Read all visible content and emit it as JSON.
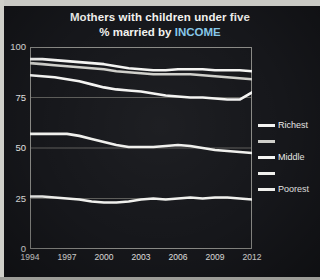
{
  "chart_data": {
    "type": "line",
    "title": "Mothers with children under five",
    "subtitle": "% married by INCOME",
    "subtitle_prefix": "% married by ",
    "subtitle_accent": "INCOME",
    "xlabel": "",
    "ylabel": "",
    "xlim": [
      1994,
      2012
    ],
    "ylim": [
      0,
      100
    ],
    "grid": true,
    "legend_position": "right",
    "y_ticks": [
      100,
      75,
      50,
      25,
      0
    ],
    "x_ticks": [
      1994,
      1997,
      2000,
      2003,
      2006,
      2009,
      2012
    ],
    "x": [
      1994,
      1995,
      1996,
      1997,
      1998,
      1999,
      2000,
      2001,
      2002,
      2003,
      2004,
      2005,
      2006,
      2007,
      2008,
      2009,
      2010,
      2011,
      2012
    ],
    "series": [
      {
        "name": "Richest",
        "color": "#f4f4f2",
        "values": [
          94,
          94,
          93.5,
          93,
          92.5,
          92,
          91.5,
          90.5,
          89.5,
          89,
          88.5,
          88.5,
          89,
          89,
          89,
          88.5,
          88.5,
          88.5,
          88
        ]
      },
      {
        "name": "",
        "color": "#cfcfca",
        "values": [
          92,
          91.5,
          91,
          90.5,
          90,
          89.5,
          89,
          88,
          87.5,
          87,
          86.5,
          86.5,
          86.5,
          86.5,
          86,
          85.5,
          85,
          84.5,
          84
        ]
      },
      {
        "name": "Middle",
        "color": "#f4f4f2",
        "values": [
          86,
          85.5,
          85,
          84,
          83,
          81.5,
          80,
          79,
          78.5,
          78,
          77,
          76,
          75.5,
          75,
          75,
          74.5,
          74,
          74,
          77.5
        ]
      },
      {
        "name": "",
        "color": "#f0f0ed",
        "values": [
          57,
          57,
          57,
          57,
          56,
          54.5,
          53,
          51.5,
          50.5,
          50.5,
          50.5,
          51,
          51.5,
          51,
          50,
          49,
          48.5,
          48,
          47.5
        ]
      },
      {
        "name": "Poorest",
        "color": "#f0f0ed",
        "values": [
          26,
          26,
          25.5,
          25,
          24.5,
          23.5,
          23,
          23,
          23.5,
          24.5,
          25,
          24.5,
          25,
          25.5,
          25,
          25.5,
          25.5,
          25,
          24.5
        ]
      }
    ],
    "legend_entries": [
      {
        "label": "Richest",
        "has_label": true
      },
      {
        "label": "",
        "has_label": false
      },
      {
        "label": "Middle",
        "has_label": true
      },
      {
        "label": "",
        "has_label": false
      },
      {
        "label": "Poorest",
        "has_label": true
      }
    ]
  }
}
